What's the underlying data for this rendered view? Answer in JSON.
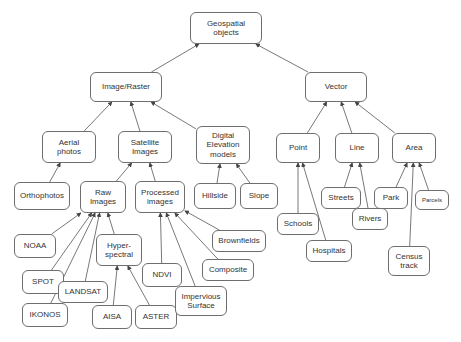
{
  "diagram": {
    "type": "tree-diagram",
    "canvas": {
      "width": 461,
      "height": 342
    },
    "style": {
      "background_color": "#ffffff",
      "node_fill": "#ffffff",
      "node_border": "#6e6e6e",
      "text_color": "#333333",
      "edge_color": "#555555"
    },
    "nodes": [
      {
        "id": "geospatial-objects",
        "label": "Geospatial\nobjects",
        "x": 190,
        "y": 12,
        "w": 72,
        "h": 32,
        "font_size": 8
      },
      {
        "id": "image-raster",
        "label": "Image/Raster",
        "x": 90,
        "y": 72,
        "w": 72,
        "h": 30,
        "font_size": 8
      },
      {
        "id": "vector",
        "label": "Vector",
        "x": 305,
        "y": 72,
        "w": 62,
        "h": 30,
        "font_size": 8
      },
      {
        "id": "aerial-photos",
        "label": "Aerial\nphotos",
        "x": 42,
        "y": 131,
        "w": 54,
        "h": 32,
        "font_size": 8
      },
      {
        "id": "satellite-images",
        "label": "Satellite\nImages",
        "x": 118,
        "y": 131,
        "w": 54,
        "h": 32,
        "font_size": 8
      },
      {
        "id": "digital-elevation-models",
        "label": "Digital\nElevation\nmodels",
        "x": 196,
        "y": 126,
        "w": 54,
        "h": 38,
        "font_size": 8
      },
      {
        "id": "point",
        "label": "Point",
        "x": 276,
        "y": 133,
        "w": 44,
        "h": 30,
        "font_size": 8
      },
      {
        "id": "line",
        "label": "Line",
        "x": 335,
        "y": 133,
        "w": 44,
        "h": 30,
        "font_size": 8
      },
      {
        "id": "area",
        "label": "Area",
        "x": 392,
        "y": 133,
        "w": 44,
        "h": 30,
        "font_size": 8
      },
      {
        "id": "orthophotos",
        "label": "Orthophotos",
        "x": 14,
        "y": 182,
        "w": 56,
        "h": 28,
        "font_size": 8
      },
      {
        "id": "raw-images",
        "label": "Raw\nImages",
        "x": 80,
        "y": 181,
        "w": 46,
        "h": 32,
        "font_size": 8
      },
      {
        "id": "processed-images",
        "label": "Processed\nimages",
        "x": 135,
        "y": 181,
        "w": 50,
        "h": 32,
        "font_size": 8
      },
      {
        "id": "hillside",
        "label": "Hillside",
        "x": 194,
        "y": 183,
        "w": 42,
        "h": 26,
        "font_size": 8
      },
      {
        "id": "slope",
        "label": "Slope",
        "x": 240,
        "y": 183,
        "w": 38,
        "h": 26,
        "font_size": 8
      },
      {
        "id": "streets",
        "label": "Streets",
        "x": 321,
        "y": 187,
        "w": 40,
        "h": 22,
        "font_size": 8
      },
      {
        "id": "park",
        "label": "Park",
        "x": 374,
        "y": 187,
        "w": 34,
        "h": 22,
        "font_size": 8
      },
      {
        "id": "parcels",
        "label": "Parcels",
        "x": 415,
        "y": 190,
        "w": 34,
        "h": 20,
        "font_size": 6
      },
      {
        "id": "schools",
        "label": "Schools",
        "x": 277,
        "y": 213,
        "w": 42,
        "h": 22,
        "font_size": 8
      },
      {
        "id": "rivers",
        "label": "Rivers",
        "x": 352,
        "y": 208,
        "w": 36,
        "h": 22,
        "font_size": 8
      },
      {
        "id": "census-track",
        "label": "Census\ntrack",
        "x": 388,
        "y": 246,
        "w": 42,
        "h": 30,
        "font_size": 8
      },
      {
        "id": "hospitals",
        "label": "Hospitals",
        "x": 306,
        "y": 240,
        "w": 46,
        "h": 22,
        "font_size": 8
      },
      {
        "id": "noaa",
        "label": "NOAA",
        "x": 14,
        "y": 234,
        "w": 42,
        "h": 24,
        "font_size": 8
      },
      {
        "id": "spot",
        "label": "SPOT",
        "x": 22,
        "y": 270,
        "w": 42,
        "h": 24,
        "font_size": 8
      },
      {
        "id": "ikonos",
        "label": "IKONOS",
        "x": 22,
        "y": 303,
        "w": 46,
        "h": 24,
        "font_size": 8
      },
      {
        "id": "landsat",
        "label": "LANDSAT",
        "x": 58,
        "y": 281,
        "w": 50,
        "h": 22,
        "font_size": 8
      },
      {
        "id": "hyper-spectral",
        "label": "Hyper-\nspectral",
        "x": 96,
        "y": 234,
        "w": 46,
        "h": 32,
        "font_size": 8
      },
      {
        "id": "aisa",
        "label": "AISA",
        "x": 92,
        "y": 305,
        "w": 40,
        "h": 24,
        "font_size": 8
      },
      {
        "id": "aster",
        "label": "ASTER",
        "x": 135,
        "y": 305,
        "w": 42,
        "h": 24,
        "font_size": 8
      },
      {
        "id": "ndvi",
        "label": "NDVI",
        "x": 142,
        "y": 263,
        "w": 40,
        "h": 24,
        "font_size": 8
      },
      {
        "id": "brownfields",
        "label": "Brownfields",
        "x": 212,
        "y": 230,
        "w": 54,
        "h": 22,
        "font_size": 8
      },
      {
        "id": "composite",
        "label": "Composite",
        "x": 202,
        "y": 259,
        "w": 52,
        "h": 22,
        "font_size": 8
      },
      {
        "id": "impervious-surface",
        "label": "Impervious\nSurface",
        "x": 175,
        "y": 286,
        "w": 52,
        "h": 30,
        "font_size": 8
      }
    ],
    "edges": [
      {
        "from": "image-raster",
        "to": "geospatial-objects"
      },
      {
        "from": "vector",
        "to": "geospatial-objects"
      },
      {
        "from": "aerial-photos",
        "to": "image-raster"
      },
      {
        "from": "satellite-images",
        "to": "image-raster"
      },
      {
        "from": "digital-elevation-models",
        "to": "image-raster"
      },
      {
        "from": "point",
        "to": "vector"
      },
      {
        "from": "line",
        "to": "vector"
      },
      {
        "from": "area",
        "to": "vector"
      },
      {
        "from": "orthophotos",
        "to": "aerial-photos"
      },
      {
        "from": "raw-images",
        "to": "satellite-images"
      },
      {
        "from": "processed-images",
        "to": "satellite-images"
      },
      {
        "from": "hillside",
        "to": "digital-elevation-models"
      },
      {
        "from": "slope",
        "to": "digital-elevation-models"
      },
      {
        "from": "schools",
        "to": "point"
      },
      {
        "from": "hospitals",
        "to": "point"
      },
      {
        "from": "streets",
        "to": "line"
      },
      {
        "from": "rivers",
        "to": "line"
      },
      {
        "from": "park",
        "to": "area"
      },
      {
        "from": "parcels",
        "to": "area"
      },
      {
        "from": "census-track",
        "to": "area"
      },
      {
        "from": "noaa",
        "to": "raw-images"
      },
      {
        "from": "spot",
        "to": "raw-images"
      },
      {
        "from": "ikonos",
        "to": "raw-images"
      },
      {
        "from": "landsat",
        "to": "raw-images"
      },
      {
        "from": "hyper-spectral",
        "to": "raw-images"
      },
      {
        "from": "aisa",
        "to": "hyper-spectral"
      },
      {
        "from": "aster",
        "to": "hyper-spectral"
      },
      {
        "from": "ndvi",
        "to": "processed-images"
      },
      {
        "from": "composite",
        "to": "processed-images"
      },
      {
        "from": "brownfields",
        "to": "processed-images"
      },
      {
        "from": "impervious-surface",
        "to": "processed-images"
      }
    ]
  }
}
